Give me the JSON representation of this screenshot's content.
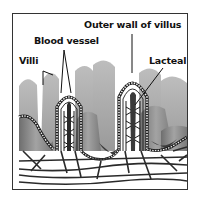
{
  "diagram": {
    "labels": {
      "outer_wall": "Outer wall of villus",
      "blood_vessel": "Blood vessel",
      "villi": "Villi",
      "lacteal": "Lacteal"
    },
    "colors": {
      "villus_fill": "#8a8a8a",
      "villus_dark": "#4a4a4a",
      "background_villi": "#b5b5b5",
      "outline": "#1a1a1a",
      "frame": "#333333"
    }
  }
}
